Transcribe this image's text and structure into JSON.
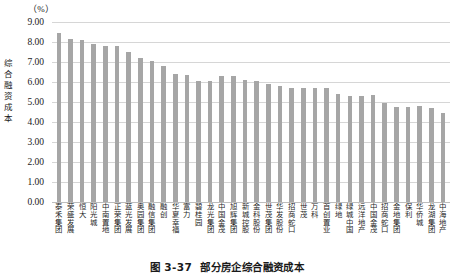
{
  "figure": {
    "caption_number": "图 3-37",
    "caption_text": "部分房企综合融资成本"
  },
  "chart_data": {
    "type": "bar",
    "title": "部分房企综合融资成本",
    "unit_label": "（%）",
    "xlabel": "",
    "ylabel": "综合融资成本",
    "ylim": [
      0.0,
      9.0
    ],
    "ytick_labels": [
      "9.00",
      "8.00",
      "7.00",
      "6.00",
      "5.00",
      "4.00",
      "3.00",
      "2.00",
      "1.00",
      "0.00"
    ],
    "ytick_values": [
      9.0,
      8.0,
      7.0,
      6.0,
      5.0,
      4.0,
      3.0,
      2.0,
      1.0,
      0.0
    ],
    "grid": true,
    "legend": "none",
    "bar_color": "#a6a6a6",
    "categories": [
      "泰禾集团",
      "荣盛发展",
      "恒大",
      "阳光城",
      "中南置地",
      "正荣集团",
      "蓝光发展",
      "奥园集团",
      "融信集团",
      "融创",
      "华夏幸福",
      "富力",
      "碧桂园",
      "龙光集团",
      "中国金茂",
      "旭辉集团",
      "新城控股",
      "金科股份",
      "世茂集团",
      "华发股份",
      "招商蛇口",
      "世茂",
      "万科",
      "首创置业",
      "绿地",
      "绿城中国",
      "远洋地产",
      "中国金茂",
      "招商蛇口",
      "金地集团",
      "保利",
      "华侨城",
      "龙湖集团",
      "中海地产"
    ],
    "values": [
      8.45,
      8.15,
      8.12,
      7.92,
      7.78,
      7.78,
      7.5,
      7.18,
      7.05,
      6.8,
      6.38,
      6.35,
      6.07,
      6.05,
      6.3,
      6.3,
      6.1,
      6.05,
      5.88,
      5.82,
      5.72,
      5.72,
      5.72,
      5.7,
      5.38,
      5.32,
      5.32,
      5.35,
      4.95,
      4.75,
      4.75,
      4.78,
      4.68,
      4.45
    ]
  }
}
